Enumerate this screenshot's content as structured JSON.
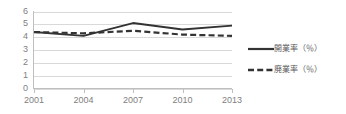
{
  "chart_data": {
    "type": "line",
    "title": "",
    "subtitle": "",
    "xlabel": "",
    "ylabel": "",
    "x": [
      2001,
      2002,
      2003,
      2004,
      2005,
      2006,
      2007,
      2008,
      2009,
      2010,
      2011,
      2012,
      2013
    ],
    "categories": [
      "2001",
      "2004",
      "2007",
      "2010",
      "2013"
    ],
    "xtick_labels": [
      "2001",
      "2004",
      "2007",
      "2010",
      "2013"
    ],
    "ytick_labels": [
      "0",
      "1",
      "2",
      "3",
      "4",
      "5",
      "6"
    ],
    "ylim": [
      0,
      6
    ],
    "xlim": [
      2001,
      2013
    ],
    "grid": true,
    "grid_axis": "y",
    "legend_position": "right",
    "series": [
      {
        "name": "開業率（％）",
        "style": "solid",
        "color": "#333333",
        "x": [
          2001,
          2004,
          2007,
          2010,
          2013
        ],
        "values": [
          4.4,
          4.1,
          5.1,
          4.6,
          4.9
        ]
      },
      {
        "name": "廃業率（％）",
        "style": "dashed",
        "color": "#333333",
        "x": [
          2001,
          2004,
          2007,
          2010,
          2013
        ],
        "values": [
          4.4,
          4.3,
          4.5,
          4.2,
          4.1
        ]
      }
    ]
  },
  "legend": {
    "items": [
      {
        "label": "開業率（％）",
        "style": "solid"
      },
      {
        "label": "廃業率（％）",
        "style": "dashed"
      }
    ]
  },
  "colors": {
    "line": "#333333",
    "grid": "#d9d9d9",
    "axis": "#bfbfbf",
    "tick_text": "#808080",
    "legend_text": "#595959",
    "background": "#ffffff"
  },
  "axes": {
    "y_ticks": [
      "6",
      "5",
      "4",
      "3",
      "2",
      "1",
      "0"
    ],
    "x_ticks": [
      "2001",
      "2004",
      "2007",
      "2010",
      "2013"
    ]
  }
}
